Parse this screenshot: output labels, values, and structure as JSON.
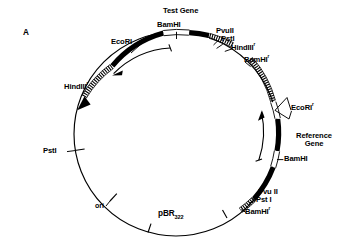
{
  "figure": {
    "panel_label": "A",
    "type": "plasmid-map",
    "backbone_name_main": "pBR",
    "backbone_name_sub": "322",
    "background_color": "#ffffff",
    "ink_color": "#000000"
  },
  "genes": [
    {
      "id": "test-gene",
      "label": "Test Gene",
      "position": "top"
    },
    {
      "id": "reference-gene",
      "label_line1": "Reference",
      "label_line2": "Gene",
      "position": "right"
    }
  ],
  "features": [
    {
      "id": "ori",
      "label": "ori",
      "position": "bottom-left"
    }
  ],
  "sites": [
    {
      "id": "bamhi-top",
      "name": "BamHI",
      "resistant": false,
      "position": "top-center"
    },
    {
      "id": "ecori-topleft",
      "name": "EcoRI",
      "resistant": false,
      "position": "top-left"
    },
    {
      "id": "pvuii-topright",
      "name": "PvuII",
      "resistant": false,
      "position": "top-right"
    },
    {
      "id": "psti-topright",
      "name": "PstI",
      "resistant": false,
      "position": "top-right"
    },
    {
      "id": "hindiii-topright",
      "name": "HindIII",
      "resistant": true,
      "position": "top-right"
    },
    {
      "id": "bamhi-topright",
      "name": "BamHI",
      "resistant": true,
      "position": "upper-right"
    },
    {
      "id": "ecori-right",
      "name": "EcoRI",
      "resistant": true,
      "position": "right"
    },
    {
      "id": "bamhi-right",
      "name": "BamHI",
      "resistant": false,
      "position": "right-lower"
    },
    {
      "id": "pvuii-bottom",
      "name": "Pvu II",
      "resistant": false,
      "position": "bottom-right"
    },
    {
      "id": "psti-bottom",
      "name": "Pst I",
      "resistant": false,
      "position": "bottom-right"
    },
    {
      "id": "bamhi-bottom",
      "name": "BamHI",
      "resistant": true,
      "position": "bottom-right"
    },
    {
      "id": "hindiii-left",
      "name": "HindIII",
      "resistant": true,
      "position": "left-upper"
    },
    {
      "id": "psti-left",
      "name": "PstI",
      "resistant": false,
      "position": "left"
    }
  ],
  "labels": {
    "panel_a": "A",
    "test_gene": "Test Gene",
    "bamhi": "BamHI",
    "ecori": "EcoRI",
    "pvuii": "PvuII",
    "psti": "PstI",
    "hindiii": "HindIII",
    "pvuii_spaced": "Pvu II",
    "psti_spaced": "Pst I",
    "reference": "Reference",
    "gene": "Gene",
    "ori": "ori",
    "pbr": "pBR",
    "pbr_sub": "322",
    "superscript_r": "r"
  }
}
